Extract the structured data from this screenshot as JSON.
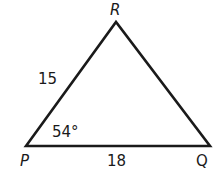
{
  "diagram": {
    "type": "triangle",
    "vertices": {
      "top": "R",
      "bottom_left": "P",
      "bottom_right": "Q"
    },
    "sides": {
      "PR": "15",
      "PQ": "18"
    },
    "angles": {
      "P": "54°"
    },
    "stroke_color": "#1a1a1a"
  }
}
